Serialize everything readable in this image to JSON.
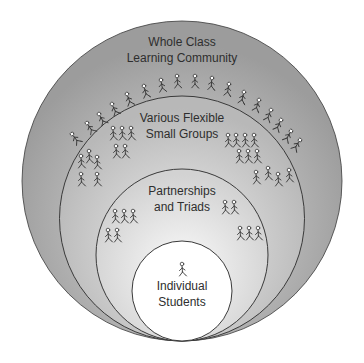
{
  "diagram": {
    "type": "nested-circles",
    "levels": [
      {
        "id": "whole-class",
        "line1": "Whole Class",
        "line2": "Learning Community",
        "cx": 182,
        "cy": 181,
        "r": 160,
        "fill_edge": "#9a9a9a",
        "fill_center": "#d6d6d6"
      },
      {
        "id": "small-groups",
        "line1": "Various Flexible",
        "line2": "Small Groups",
        "cx": 182,
        "cy": 218.5,
        "r": 122.5,
        "fill_edge": "#b5b5b5",
        "fill_center": "#e6e6e6"
      },
      {
        "id": "partnerships",
        "line1": "Partnerships",
        "line2": "and Triads",
        "cx": 182,
        "cy": 255,
        "r": 86,
        "fill_edge": "#cfcfcf",
        "fill_center": "#f4f4f4"
      },
      {
        "id": "individual",
        "line1": "Individual",
        "line2": "Students",
        "cx": 182,
        "cy": 291,
        "r": 50,
        "fill_edge": "#ffffff",
        "fill_center": "#ffffff"
      }
    ],
    "stroke_color": "#3a3a3a",
    "figure_groups": {
      "whole_class_arc": [
        [
          72,
          134
        ],
        [
          87,
          123
        ],
        [
          99,
          114
        ],
        [
          112,
          104
        ],
        [
          127,
          94
        ],
        [
          144,
          86
        ],
        [
          161,
          80
        ],
        [
          177,
          76
        ],
        [
          195,
          76
        ],
        [
          212,
          78
        ],
        [
          229,
          84
        ],
        [
          244,
          92
        ],
        [
          259,
          100
        ],
        [
          271,
          110
        ],
        [
          281,
          120
        ],
        [
          291,
          131
        ],
        [
          300,
          140
        ]
      ],
      "small_groups": [
        [
          [
            113,
            128
          ],
          [
            122,
            128
          ],
          [
            131,
            128
          ]
        ],
        [
          [
            116,
            146
          ],
          [
            125,
            146
          ]
        ],
        [
          [
            81,
            156
          ],
          [
            89,
            151
          ],
          [
            97,
            157
          ]
        ],
        [
          [
            81,
            174
          ],
          [
            97,
            174
          ]
        ],
        [
          [
            228,
            135
          ],
          [
            236,
            135
          ],
          [
            245,
            135
          ],
          [
            254,
            135
          ]
        ],
        [
          [
            239,
            151
          ],
          [
            248,
            151
          ],
          [
            257,
            151
          ]
        ],
        [
          [
            256,
            172
          ],
          [
            268,
            168
          ],
          [
            278,
            174
          ],
          [
            289,
            170
          ]
        ]
      ],
      "partnerships": [
        [
          [
            115,
            211
          ],
          [
            124,
            211
          ],
          [
            133,
            211
          ]
        ],
        [
          [
            108,
            230
          ],
          [
            117,
            230
          ]
        ],
        [
          [
            225,
            202
          ],
          [
            234,
            202
          ]
        ],
        [
          [
            240,
            228
          ],
          [
            249,
            228
          ],
          [
            258,
            228
          ]
        ]
      ],
      "individual": [
        [
          182,
          264
        ]
      ]
    }
  }
}
